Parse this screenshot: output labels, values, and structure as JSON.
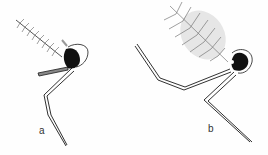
{
  "figure": {
    "panels": [
      {
        "label": "a",
        "label_x": 39,
        "label_y": 126
      },
      {
        "label": "b",
        "label_x": 208,
        "label_y": 124
      }
    ],
    "colors": {
      "ink": "#1a1a1a",
      "background": "#fefefe",
      "hair": "#8a8a8a"
    }
  }
}
